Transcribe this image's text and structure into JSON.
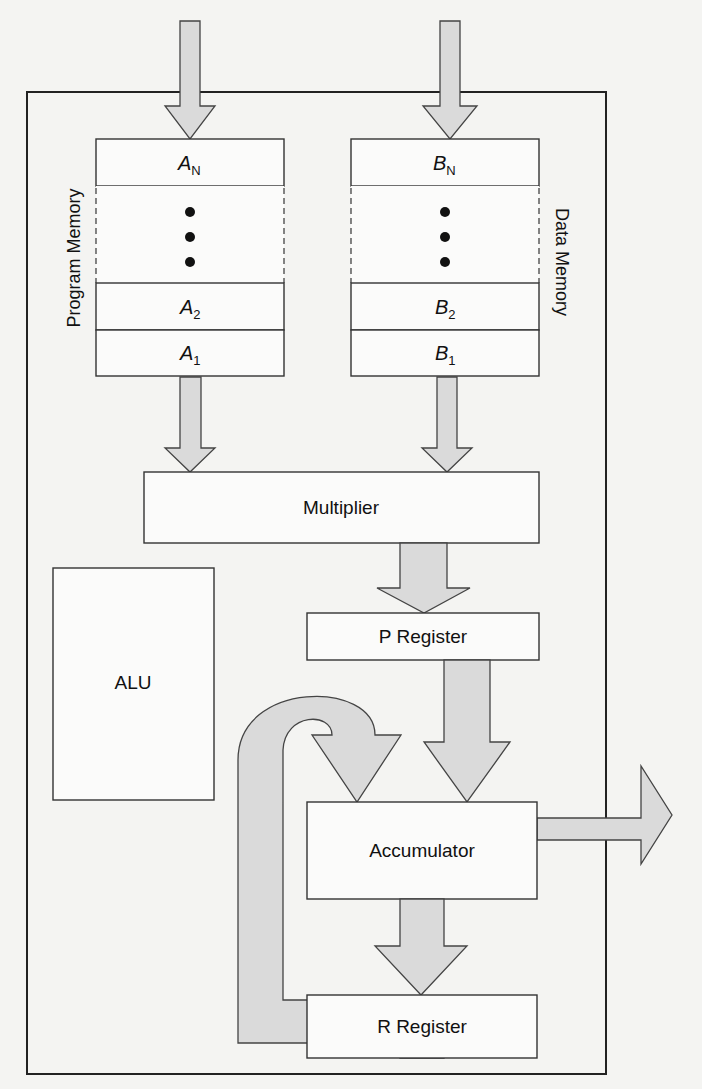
{
  "diagram": {
    "program_memory": {
      "label": "Program Memory",
      "cells": [
        {
          "symbol": "A",
          "subscript": "N"
        },
        {
          "symbol": "A",
          "subscript": "2"
        },
        {
          "symbol": "A",
          "subscript": "1"
        }
      ],
      "ellipsis": "•••"
    },
    "data_memory": {
      "label": "Data Memory",
      "cells": [
        {
          "symbol": "B",
          "subscript": "N"
        },
        {
          "symbol": "B",
          "subscript": "2"
        },
        {
          "symbol": "B",
          "subscript": "1"
        }
      ],
      "ellipsis": "•••"
    },
    "blocks": {
      "multiplier": "Multiplier",
      "alu": "ALU",
      "p_register": "P Register",
      "accumulator": "Accumulator",
      "r_register": "R Register"
    },
    "flows": [
      {
        "from": "input",
        "to": "program_memory"
      },
      {
        "from": "input",
        "to": "data_memory"
      },
      {
        "from": "program_memory",
        "to": "multiplier"
      },
      {
        "from": "data_memory",
        "to": "multiplier"
      },
      {
        "from": "multiplier",
        "to": "p_register"
      },
      {
        "from": "p_register",
        "to": "accumulator"
      },
      {
        "from": "accumulator",
        "to": "r_register"
      },
      {
        "from": "r_register",
        "to": "accumulator",
        "type": "feedback"
      },
      {
        "from": "accumulator",
        "to": "output"
      }
    ],
    "colors": {
      "arrow_fill": "#dadada",
      "box_fill": "#fbfbfa",
      "stroke": "#333333",
      "background": "#f4f4f2"
    }
  }
}
